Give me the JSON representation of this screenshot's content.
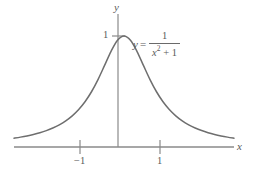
{
  "figure": {
    "background_color": "#ffffff",
    "axis_color": "#8a8a8a",
    "curve_color": "#6e6e6e",
    "text_color": "#5a5a5a"
  },
  "labels": {
    "x_axis": "x",
    "y_axis": "y",
    "tick_neg1": "−1",
    "tick_pos1": "1",
    "tick_ymax": "1"
  },
  "equation": {
    "lhs": "y",
    "equals": "=",
    "numerator": "1",
    "denominator_base": "x",
    "denominator_exponent": "2",
    "denominator_rest": "+ 1",
    "plain": "y = 1/(x^2 + 1)"
  },
  "chart_data": {
    "type": "line",
    "title": "",
    "xlabel": "x",
    "ylabel": "y",
    "function": "y = 1/(x^2 + 1)",
    "xlim": [
      -3.4,
      3.4
    ],
    "ylim": [
      0,
      1.12
    ],
    "xticks": [
      -1,
      1
    ],
    "xticklabels": [
      "−1",
      "1"
    ],
    "yticks": [
      1
    ],
    "yticklabels": [
      "1"
    ],
    "grid": false,
    "legend": false,
    "annotations": [
      {
        "text": "y = 1/(x^2 + 1)",
        "x": 0.55,
        "y": 0.92
      }
    ],
    "x": [
      -3.4,
      -3.2,
      -3.0,
      -2.8,
      -2.6,
      -2.4,
      -2.2,
      -2.0,
      -1.8,
      -1.6,
      -1.4,
      -1.2,
      -1.0,
      -0.8,
      -0.6,
      -0.4,
      -0.2,
      0.0,
      0.2,
      0.4,
      0.6,
      0.8,
      1.0,
      1.2,
      1.4,
      1.6,
      1.8,
      2.0,
      2.2,
      2.4,
      2.6,
      2.8,
      3.0,
      3.2,
      3.4
    ],
    "y": [
      0.0796,
      0.089,
      0.1,
      0.1131,
      0.1289,
      0.1479,
      0.1712,
      0.2,
      0.2358,
      0.2809,
      0.3378,
      0.4098,
      0.5,
      0.6098,
      0.7353,
      0.8621,
      0.9615,
      1.0,
      0.9615,
      0.8621,
      0.7353,
      0.6098,
      0.5,
      0.4098,
      0.3378,
      0.2809,
      0.2358,
      0.2,
      0.1712,
      0.1479,
      0.1289,
      0.1131,
      0.1,
      0.089,
      0.0796
    ]
  }
}
